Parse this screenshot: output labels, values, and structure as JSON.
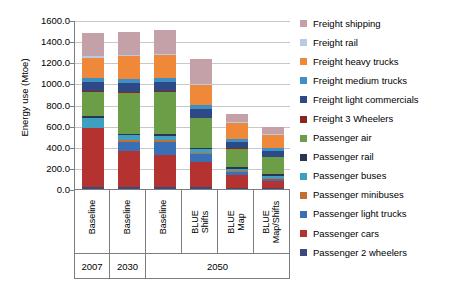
{
  "chart_data": {
    "type": "bar",
    "stacked": true,
    "title": "",
    "xlabel": "",
    "ylabel": "Energy use (Mtoe)",
    "ylim": [
      0,
      1600
    ],
    "ytick_labels": [
      "0.0",
      "200.0",
      "400.0",
      "600.0",
      "800.0",
      "1000.0",
      "1200.0",
      "1400.0",
      "1600.0"
    ],
    "ytick_values": [
      0,
      200,
      400,
      600,
      800,
      1000,
      1200,
      1400,
      1600
    ],
    "grid": true,
    "legend_position": "right",
    "categories": [
      "Baseline",
      "Baseline",
      "Baseline",
      "BLUE Shifts",
      "BLUE Map",
      "BLUE Map/Shifts"
    ],
    "group_labels": [
      "2007",
      "2030",
      "2050"
    ],
    "group_spans": [
      1,
      1,
      4
    ],
    "series": [
      {
        "name": "Passenger 2 wheelers",
        "color": "#3b4a7a",
        "values": [
          20,
          22,
          22,
          18,
          12,
          10
        ]
      },
      {
        "name": "Passenger cars",
        "color": "#b43230",
        "values": [
          560,
          340,
          300,
          235,
          118,
          62
        ]
      },
      {
        "name": "Passenger light trucks",
        "color": "#3a6fb5",
        "values": [
          0,
          88,
          128,
          75,
          28,
          22
        ]
      },
      {
        "name": "Passenger minibuses",
        "color": "#c1702f",
        "values": [
          0,
          14,
          14,
          10,
          8,
          8
        ]
      },
      {
        "name": "Passenger buses",
        "color": "#3e9fc0",
        "values": [
          96,
          48,
          42,
          38,
          26,
          24
        ]
      },
      {
        "name": "Passenger rail",
        "color": "#2c3550",
        "values": [
          14,
          14,
          14,
          14,
          14,
          14
        ]
      },
      {
        "name": "Passenger air",
        "color": "#6b9e47",
        "values": [
          230,
          385,
          400,
          280,
          175,
          160
        ]
      },
      {
        "name": "Freight 3 Wheelers",
        "color": "#8c2420",
        "values": [
          6,
          6,
          6,
          6,
          5,
          5
        ]
      },
      {
        "name": "Freight light commercials",
        "color": "#2e4a86",
        "values": [
          85,
          85,
          85,
          78,
          60,
          55
        ]
      },
      {
        "name": "Freight medium trucks",
        "color": "#3d8fc4",
        "values": [
          42,
          42,
          42,
          38,
          28,
          26
        ]
      },
      {
        "name": "Freight heavy trucks",
        "color": "#f0883a",
        "values": [
          192,
          212,
          215,
          190,
          148,
          122
        ]
      },
      {
        "name": "Freight rail",
        "color": "#b9cbe0",
        "values": [
          14,
          14,
          14,
          14,
          12,
          12
        ]
      },
      {
        "name": "Freight shipping",
        "color": "#c4a0a8",
        "values": [
          218,
          222,
          228,
          232,
          80,
          72
        ]
      }
    ],
    "legend_entries": [
      {
        "label": "Freight shipping",
        "color": "#c4a0a8"
      },
      {
        "label": "Freight rail",
        "color": "#b9cbe0"
      },
      {
        "label": "Freight heavy trucks",
        "color": "#f0883a"
      },
      {
        "label": "Freight medium trucks",
        "color": "#3d8fc4"
      },
      {
        "label": "Freight light commercials",
        "color": "#2e4a86"
      },
      {
        "label": "Freight 3 Wheelers",
        "color": "#8c2420"
      },
      {
        "label": "Passenger air",
        "color": "#6b9e47"
      },
      {
        "label": "Passenger rail",
        "color": "#2c3550"
      },
      {
        "label": "Passenger buses",
        "color": "#3e9fc0"
      },
      {
        "label": "Passenger minibuses",
        "color": "#c1702f"
      },
      {
        "label": "Passenger light trucks",
        "color": "#3a6fb5"
      },
      {
        "label": "Passenger cars",
        "color": "#b43230"
      },
      {
        "label": "Passenger 2 wheelers",
        "color": "#3b4a7a"
      }
    ],
    "bar_totals": [
      1477,
      1492,
      1510,
      1228,
      714,
      592
    ]
  }
}
